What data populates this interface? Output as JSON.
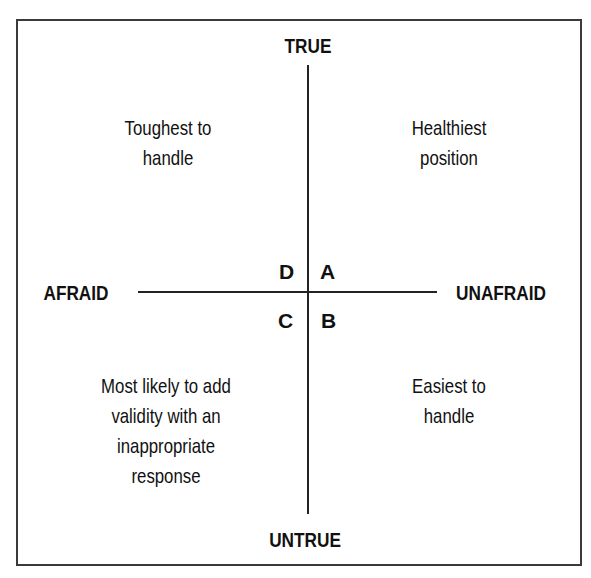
{
  "diagram": {
    "type": "quadrant",
    "axes": {
      "top": "TRUE",
      "bottom": "UNTRUE",
      "left": "AFRAID",
      "right": "UNAFRAID"
    },
    "quadrants": [
      {
        "letter": "D",
        "position": "top-left",
        "description": [
          "Toughest to",
          "handle"
        ]
      },
      {
        "letter": "A",
        "position": "top-right",
        "description": [
          "Healthiest",
          "position"
        ]
      },
      {
        "letter": "C",
        "position": "bottom-left",
        "description": [
          "Most likely to add",
          "validity with an",
          "inappropriate",
          "response"
        ]
      },
      {
        "letter": "B",
        "position": "bottom-right",
        "description": [
          "Easiest to",
          "handle"
        ]
      }
    ]
  }
}
